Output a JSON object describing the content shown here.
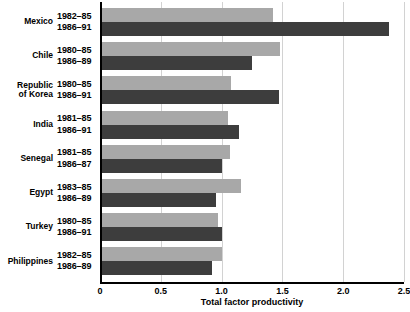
{
  "chart_data": {
    "type": "bar",
    "orientation": "horizontal",
    "title": "",
    "xlabel": "Total factor productivity",
    "ylabel": "",
    "xlim": [
      0,
      2.5
    ],
    "xticks": [
      "0",
      "0.5",
      "1.0",
      "1.5",
      "2.0",
      "2.5"
    ],
    "xtick_values": [
      0,
      0.5,
      1.0,
      1.5,
      2.0,
      2.5
    ],
    "grid": true,
    "grid_axis": "x",
    "legend": "none",
    "categories": [
      "Mexico",
      "Chile",
      "Republic of Korea",
      "India",
      "Senegal",
      "Egypt",
      "Turkey",
      "Philippines"
    ],
    "series": [
      {
        "name": "earlier period",
        "color": "#a8a8a8",
        "period_labels": [
          "1982–85",
          "1980–85",
          "1980–85",
          "1981–85",
          "1981–85",
          "1983–85",
          "1980–85",
          "1982–85"
        ],
        "values": [
          1.42,
          1.48,
          1.08,
          1.05,
          1.07,
          1.16,
          0.97,
          1.0
        ]
      },
      {
        "name": "later period",
        "color": "#3d3d3d",
        "period_labels": [
          "1986–91",
          "1986–89",
          "1986–91",
          "1986–91",
          "1986–87",
          "1986–89",
          "1986–91",
          "1986–89"
        ],
        "values": [
          2.38,
          1.25,
          1.47,
          1.14,
          1.0,
          0.95,
          1.0,
          0.92
        ]
      }
    ],
    "rows": [
      {
        "country": "Mexico",
        "country_lines": [
          "Mexico"
        ],
        "period_a": "1982–85",
        "period_b": "1986–91",
        "value_a": 1.42,
        "value_b": 2.38
      },
      {
        "country": "Chile",
        "country_lines": [
          "Chile"
        ],
        "period_a": "1980–85",
        "period_b": "1986–89",
        "value_a": 1.48,
        "value_b": 1.25
      },
      {
        "country": "Republic of Korea",
        "country_lines": [
          "Republic",
          "of Korea"
        ],
        "period_a": "1980–85",
        "period_b": "1986–91",
        "value_a": 1.08,
        "value_b": 1.47
      },
      {
        "country": "India",
        "country_lines": [
          "India"
        ],
        "period_a": "1981–85",
        "period_b": "1986–91",
        "value_a": 1.05,
        "value_b": 1.14
      },
      {
        "country": "Senegal",
        "country_lines": [
          "Senegal"
        ],
        "period_a": "1981–85",
        "period_b": "1986–87",
        "value_a": 1.07,
        "value_b": 1.0
      },
      {
        "country": "Egypt",
        "country_lines": [
          "Egypt"
        ],
        "period_a": "1983–85",
        "period_b": "1986–89",
        "value_a": 1.16,
        "value_b": 0.95
      },
      {
        "country": "Turkey",
        "country_lines": [
          "Turkey"
        ],
        "period_a": "1980–85",
        "period_b": "1986–91",
        "value_a": 0.97,
        "value_b": 1.0
      },
      {
        "country": "Philippines",
        "country_lines": [
          "Philippines"
        ],
        "period_a": "1982–85",
        "period_b": "1986–89",
        "value_a": 1.0,
        "value_b": 0.92
      }
    ]
  }
}
